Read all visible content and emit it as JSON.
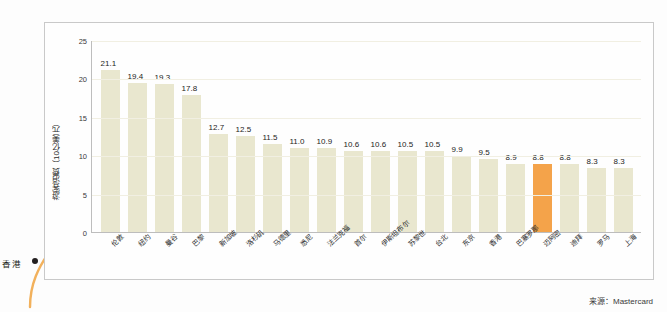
{
  "annotation": {
    "label": "香港",
    "icon": "curved-arrow"
  },
  "source_note": "来源：Mastercard",
  "chart_data": {
    "type": "bar",
    "title": "",
    "xlabel": "",
    "ylabel": "游客消费（10亿美元）",
    "ylim": [
      0,
      25
    ],
    "yticks": [
      25,
      20,
      15,
      10,
      5,
      0
    ],
    "grid": true,
    "legend": "none",
    "highlight_category": "迈阿密",
    "highlight_color": "#f4a34a",
    "bar_color": "#e9e7cf",
    "categories": [
      "伦敦",
      "纽约",
      "曼谷",
      "巴黎",
      "新加坡",
      "洛杉矶",
      "马德里",
      "悉尼",
      "法兰克福",
      "首尔",
      "伊斯坦布尔",
      "苏黎世",
      "台北",
      "东京",
      "香港",
      "巴塞罗那",
      "迈阿密",
      "迪拜",
      "罗马",
      "上海"
    ],
    "values": [
      21.1,
      19.4,
      19.3,
      17.8,
      12.7,
      12.5,
      11.5,
      11.0,
      10.9,
      10.6,
      10.6,
      10.5,
      10.5,
      9.9,
      9.5,
      8.9,
      8.8,
      8.8,
      8.3,
      8.3
    ],
    "value_labels": [
      "21.1",
      "19.4",
      "19.3",
      "17.8",
      "12.7",
      "12.5",
      "11.5",
      "11.0",
      "10.9",
      "10.6",
      "10.6",
      "10.5",
      "10.5",
      "9.9",
      "9.5",
      "8.9",
      "8.8",
      "8.8",
      "8.3",
      "8.3"
    ]
  }
}
